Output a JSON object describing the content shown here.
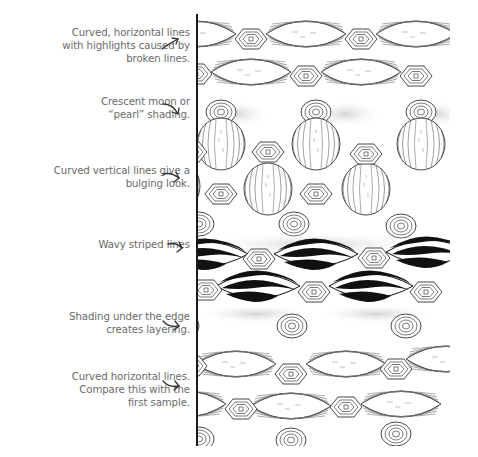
{
  "illustration": {
    "subject": "Zentangle-style pattern sample with six horizontal bands",
    "bands": [
      {
        "name": "curved-horizontal-lines-broken",
        "style": "horizontal-lines"
      },
      {
        "name": "pearl-shading",
        "style": "pearl"
      },
      {
        "name": "curved-vertical-lines-bulging",
        "style": "vertical-lines"
      },
      {
        "name": "wavy-striped-lines",
        "style": "black-stripes"
      },
      {
        "name": "shading-under-edge",
        "style": "pearl"
      },
      {
        "name": "curved-horizontal-lines",
        "style": "horizontal-lines"
      }
    ],
    "colors": {
      "ink": "#1a1a1a",
      "caption": "#6a6a6a",
      "shade": "#bdbdbd",
      "paper": "#ffffff"
    }
  },
  "captions": [
    {
      "lines": [
        "Curved, horizontal lines",
        "with highlights caused by",
        "broken lines."
      ],
      "arrow": "arrow-up-right-icon"
    },
    {
      "lines": [
        "Crescent moon or",
        "“pearl” shading."
      ],
      "arrow": "arrow-curve-down-right-icon"
    },
    {
      "lines": [
        "Curved vertical lines give a",
        "bulging look."
      ],
      "arrow": "arrow-curve-right-icon"
    },
    {
      "lines": [
        "Wavy striped lines"
      ],
      "arrow": "arrow-curve-right-icon"
    },
    {
      "lines": [
        "Shading under the edge",
        "creates layering."
      ],
      "arrow": "arrow-curve-right-icon"
    },
    {
      "lines": [
        "Curved horizontal lines.",
        "Compare this with the",
        "first sample."
      ],
      "arrow": "arrow-curve-right-icon"
    }
  ]
}
